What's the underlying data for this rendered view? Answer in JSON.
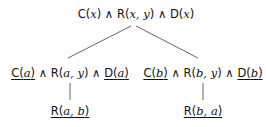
{
  "root": {
    "parts": [
      {
        "text": "C(",
        "var": "x",
        "close": ")",
        "underline": false
      },
      {
        "op": " ∧ "
      },
      {
        "text": "R(",
        "var": "x, y",
        "close": ")",
        "underline": false
      },
      {
        "op": " ∧ "
      },
      {
        "text": "D(",
        "var": "x",
        "close": ")",
        "underline": false
      }
    ]
  },
  "left": {
    "c": {
      "pre": "C(",
      "v": "a",
      "post": ")"
    },
    "op1": " ∧ ",
    "r": {
      "pre": "R(",
      "v": "a, y",
      "post": ")"
    },
    "op2": " ∧ ",
    "d": {
      "pre": "D(",
      "v": "a",
      "post": ")"
    },
    "child": {
      "pre": "R(",
      "v": "a, b",
      "post": ")"
    }
  },
  "right": {
    "c": {
      "pre": "C(",
      "v": "b",
      "post": ")"
    },
    "op1": " ∧ ",
    "r": {
      "pre": "R(",
      "v": "b, y",
      "post": ")"
    },
    "op2": " ∧ ",
    "d": {
      "pre": "D(",
      "v": "b",
      "post": ")"
    },
    "child": {
      "pre": "R(",
      "v": "b, a",
      "post": ")"
    }
  },
  "root_text": {
    "c_pre": "C(",
    "c_v": "x",
    "c_post": ")",
    "op1": " ∧ ",
    "r_pre": "R(",
    "r_v": "x, y",
    "r_post": ")",
    "op2": " ∧ ",
    "d_pre": "D(",
    "d_v": "x",
    "d_post": ")"
  },
  "line_color": "#444444"
}
